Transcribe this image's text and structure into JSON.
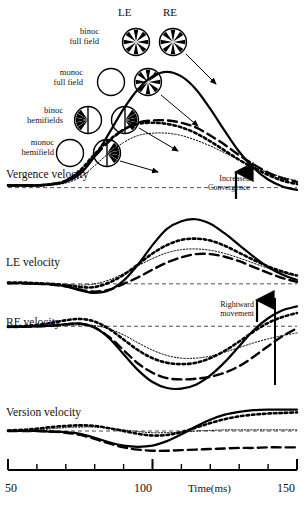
{
  "figure": {
    "column_headers": [
      "LE",
      "RE"
    ],
    "x_axis": {
      "label": "Time(ms)",
      "min": 50,
      "max": 150,
      "tick_step": 10,
      "tick_labels": [
        "50",
        "100",
        "150"
      ]
    },
    "legend": [
      {
        "key": "binoc_full",
        "label_line1": "binoc",
        "label_line2": "full field",
        "le_icon": "spoke-wheel-full",
        "re_icon": "spoke-wheel-full",
        "line_style": "solid"
      },
      {
        "key": "monoc_full",
        "label_line1": "monoc",
        "label_line2": "full field",
        "le_icon": "empty-circle",
        "re_icon": "spoke-wheel-full",
        "line_style": "dashed"
      },
      {
        "key": "binoc_hemi",
        "label_line1": "binoc",
        "label_line2": "hemifields",
        "le_icon": "spoke-wheel-hemi-left",
        "re_icon": "spoke-wheel-hemi-right",
        "line_style": "dotted-bold"
      },
      {
        "key": "monoc_hemi",
        "label_line1": "monoc",
        "label_line2": "hemifield",
        "le_icon": "empty-circle",
        "re_icon": "spoke-wheel-hemi-right",
        "line_style": "dotted-fine"
      }
    ],
    "panels": [
      {
        "key": "vergence",
        "title": "Vergence velocity",
        "annotation": {
          "line1": "Increased",
          "line2": "Convergence",
          "arrow": "up-arrow-icon"
        }
      },
      {
        "key": "le",
        "title": "LE velocity",
        "annotation": null
      },
      {
        "key": "re",
        "title": "RE velocity",
        "annotation": {
          "line1": "Rightward",
          "line2": "movement",
          "arrow": "up-arrow-icon"
        },
        "scale_bar": true
      },
      {
        "key": "version",
        "title": "Version velocity",
        "annotation": null
      }
    ]
  },
  "chart_data": {
    "type": "line",
    "title": "",
    "xlabel": "Time(ms)",
    "ylabel": "",
    "xlim": [
      50,
      150
    ],
    "grid": false,
    "legend_position": "upper-left-icons",
    "x": [
      50,
      55,
      60,
      65,
      70,
      75,
      80,
      85,
      90,
      95,
      100,
      105,
      110,
      115,
      120,
      125,
      130,
      135,
      140,
      145,
      150
    ],
    "panels": [
      {
        "name": "Vergence velocity",
        "ylim": [
          -0.15,
          1.05
        ],
        "zero_line": true,
        "series": [
          {
            "name": "binoc full field",
            "style": "solid",
            "values": [
              0.02,
              0.02,
              0.02,
              0.03,
              0.05,
              0.12,
              0.27,
              0.47,
              0.68,
              0.85,
              0.96,
              1.0,
              0.96,
              0.85,
              0.68,
              0.49,
              0.31,
              0.17,
              0.07,
              0.01,
              -0.02
            ]
          },
          {
            "name": "monoc full field",
            "style": "dashed",
            "values": [
              0.02,
              0.02,
              0.02,
              0.03,
              0.06,
              0.14,
              0.27,
              0.4,
              0.5,
              0.56,
              0.58,
              0.58,
              0.56,
              0.52,
              0.45,
              0.37,
              0.28,
              0.2,
              0.13,
              0.08,
              0.05
            ]
          },
          {
            "name": "binoc hemifields",
            "style": "dotted-bold",
            "values": [
              0.02,
              0.02,
              0.02,
              0.03,
              0.06,
              0.15,
              0.29,
              0.41,
              0.5,
              0.55,
              0.56,
              0.55,
              0.52,
              0.47,
              0.4,
              0.32,
              0.24,
              0.17,
              0.11,
              0.06,
              0.03
            ]
          },
          {
            "name": "monoc hemifield",
            "style": "dotted-fine",
            "values": [
              0.01,
              0.01,
              0.01,
              0.02,
              0.04,
              0.09,
              0.19,
              0.3,
              0.39,
              0.45,
              0.47,
              0.47,
              0.45,
              0.41,
              0.36,
              0.3,
              0.24,
              0.18,
              0.13,
              0.09,
              0.06
            ]
          }
        ]
      },
      {
        "name": "LE velocity",
        "ylim": [
          -0.25,
          1.05
        ],
        "zero_line": true,
        "series": [
          {
            "name": "binoc full field",
            "style": "solid",
            "values": [
              0.01,
              0.01,
              0.0,
              -0.01,
              -0.04,
              -0.1,
              -0.14,
              -0.1,
              0.05,
              0.3,
              0.6,
              0.85,
              0.97,
              1.0,
              0.93,
              0.78,
              0.6,
              0.42,
              0.26,
              0.14,
              0.06
            ]
          },
          {
            "name": "monoc full field",
            "style": "dashed",
            "values": [
              0.01,
              0.01,
              0.0,
              -0.01,
              -0.04,
              -0.09,
              -0.12,
              -0.09,
              0.0,
              0.1,
              0.22,
              0.33,
              0.41,
              0.46,
              0.46,
              0.42,
              0.35,
              0.26,
              0.17,
              0.09,
              0.03
            ]
          },
          {
            "name": "binoc hemifields",
            "style": "dotted-bold",
            "values": [
              0.02,
              0.02,
              0.01,
              0.0,
              -0.02,
              -0.05,
              -0.05,
              0.02,
              0.14,
              0.3,
              0.47,
              0.6,
              0.68,
              0.7,
              0.67,
              0.59,
              0.48,
              0.37,
              0.27,
              0.19,
              0.13
            ]
          },
          {
            "name": "monoc hemifield",
            "style": "dotted-fine",
            "values": [
              0.01,
              0.01,
              0.01,
              0.0,
              -0.01,
              -0.02,
              0.0,
              0.06,
              0.16,
              0.28,
              0.39,
              0.48,
              0.53,
              0.54,
              0.52,
              0.47,
              0.4,
              0.32,
              0.24,
              0.17,
              0.12
            ]
          }
        ]
      },
      {
        "name": "RE velocity",
        "ylim": [
          -1.05,
          0.35
        ],
        "zero_line": true,
        "scale_bar_x": 137,
        "series": [
          {
            "name": "binoc full field",
            "style": "solid",
            "values": [
              -0.01,
              -0.01,
              0.0,
              0.01,
              0.03,
              0.04,
              -0.02,
              -0.18,
              -0.42,
              -0.66,
              -0.84,
              -0.93,
              -0.94,
              -0.88,
              -0.74,
              -0.54,
              -0.3,
              -0.06,
              0.12,
              0.24,
              0.3
            ]
          },
          {
            "name": "monoc full field",
            "style": "dashed",
            "values": [
              -0.01,
              -0.01,
              0.0,
              0.01,
              0.03,
              0.04,
              -0.02,
              -0.16,
              -0.36,
              -0.56,
              -0.7,
              -0.78,
              -0.8,
              -0.79,
              -0.76,
              -0.7,
              -0.6,
              -0.46,
              -0.3,
              -0.15,
              -0.03
            ]
          },
          {
            "name": "binoc hemifields",
            "style": "dotted-bold",
            "values": [
              -0.01,
              0.0,
              0.02,
              0.05,
              0.09,
              0.11,
              0.07,
              -0.04,
              -0.2,
              -0.36,
              -0.48,
              -0.55,
              -0.57,
              -0.55,
              -0.48,
              -0.37,
              -0.23,
              -0.08,
              0.05,
              0.14,
              0.2
            ]
          },
          {
            "name": "monoc hemifield",
            "style": "dotted-fine",
            "values": [
              -0.01,
              -0.01,
              -0.01,
              0.0,
              0.01,
              0.02,
              0.01,
              -0.04,
              -0.13,
              -0.25,
              -0.36,
              -0.44,
              -0.48,
              -0.48,
              -0.45,
              -0.39,
              -0.32,
              -0.25,
              -0.19,
              -0.14,
              -0.1
            ]
          }
        ]
      },
      {
        "name": "Version velocity",
        "ylim": [
          -0.55,
          0.55
        ],
        "zero_line": true,
        "series": [
          {
            "name": "binoc full field",
            "style": "solid",
            "values": [
              0.0,
              0.0,
              0.0,
              -0.01,
              -0.02,
              -0.05,
              -0.12,
              -0.2,
              -0.26,
              -0.28,
              -0.26,
              -0.18,
              -0.06,
              0.08,
              0.2,
              0.29,
              0.34,
              0.37,
              0.38,
              0.38,
              0.38
            ]
          },
          {
            "name": "monoc full field",
            "style": "dashed",
            "values": [
              0.0,
              0.0,
              0.0,
              -0.01,
              -0.03,
              -0.07,
              -0.14,
              -0.22,
              -0.29,
              -0.33,
              -0.35,
              -0.35,
              -0.34,
              -0.33,
              -0.32,
              -0.31,
              -0.3,
              -0.3,
              -0.29,
              -0.29,
              -0.29
            ]
          },
          {
            "name": "binoc hemifields",
            "style": "dotted-bold",
            "values": [
              0.01,
              0.02,
              0.04,
              0.07,
              0.09,
              0.1,
              0.09,
              0.05,
              0.0,
              -0.05,
              -0.08,
              -0.07,
              -0.02,
              0.06,
              0.14,
              0.21,
              0.26,
              0.29,
              0.31,
              0.32,
              0.33
            ]
          },
          {
            "name": "monoc hemifield",
            "style": "dotted-fine",
            "values": [
              0.0,
              0.01,
              0.02,
              0.04,
              0.06,
              0.07,
              0.07,
              0.05,
              0.02,
              -0.01,
              -0.03,
              -0.03,
              -0.02,
              0.0,
              0.01,
              0.02,
              0.02,
              0.02,
              0.02,
              0.02,
              0.02
            ]
          }
        ]
      }
    ]
  }
}
